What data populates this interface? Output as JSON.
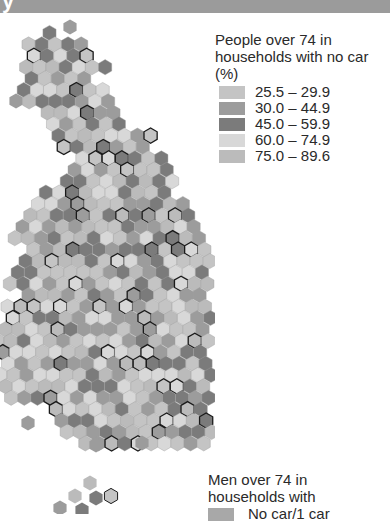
{
  "header": {
    "title_fragment": "y"
  },
  "legend": {
    "title": "People over 74 in households with no car (%)",
    "items": [
      {
        "label": "25.5 – 29.9",
        "color": "#c4c4c4"
      },
      {
        "label": "30.0 – 44.9",
        "color": "#9c9c9c"
      },
      {
        "label": "45.0 – 59.9",
        "color": "#7b7b7b"
      },
      {
        "label": "60.0 – 74.9",
        "color": "#d8d8d8"
      },
      {
        "label": "75.0 – 89.6",
        "color": "#bbbbbb"
      }
    ]
  },
  "legend2": {
    "title": "Men over 74 in households with",
    "items": [
      {
        "label": "No car/1 car",
        "color": "#a8a8a8"
      }
    ]
  },
  "map": {
    "type": "hex-cartogram",
    "region": "Great Britain",
    "outline_colors": {
      "cluster": "#1a1a1a",
      "boundary": "#ffffff"
    }
  }
}
